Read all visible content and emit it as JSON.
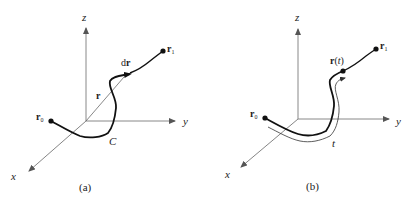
{
  "panels": [
    {
      "id": "a",
      "caption": "(a)",
      "axes": {
        "x": "x",
        "y": "y",
        "z": "z"
      },
      "labels": {
        "start_point": "r",
        "start_sub": "0",
        "end_point": "r",
        "end_sub": "1",
        "position_vector": "r",
        "differential_d": "d",
        "differential_r": "r",
        "curve": "C"
      }
    },
    {
      "id": "b",
      "caption": "(b)",
      "axes": {
        "x": "x",
        "y": "y",
        "z": "z"
      },
      "labels": {
        "start_point": "r",
        "start_sub": "0",
        "end_point": "r",
        "end_sub": "1",
        "param_point": "r",
        "param_open": "(",
        "param_var": "t",
        "param_close": ")",
        "arc_length": "t"
      }
    }
  ],
  "colors": {
    "axis": "#888888",
    "curve": "#111111",
    "text": "#222222"
  }
}
